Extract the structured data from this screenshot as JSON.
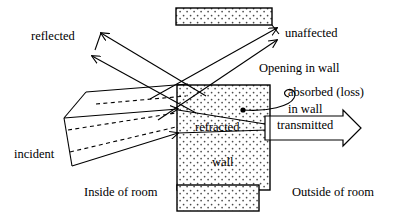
{
  "figure": {
    "background_color": "#ffffff",
    "line_color": "#000000",
    "fill_pattern": "dotted-stipple"
  },
  "labels": {
    "reflected": "reflected",
    "unaffected": "unaffected",
    "opening_in_wall": "Opening in wall",
    "absorbed": "absorbed (loss)",
    "in_wall": "in wall",
    "refracted": "refracted",
    "transmitted": "transmitted",
    "incident": "incident",
    "wall": "wall",
    "inside_of_room": "Inside of room",
    "outside_of_room": "Outside of room"
  },
  "shapes": {
    "opening_block": {
      "x": 176,
      "y": 8,
      "width": 96,
      "height": 17
    },
    "wall_block": {
      "x": 177,
      "y": 85,
      "width": 93,
      "height": 105
    },
    "legend_swatch": {
      "x": 177,
      "y": 185,
      "width": 82,
      "height": 26
    },
    "absorption_point": {
      "x": 243,
      "y": 110,
      "r": 2.6
    }
  },
  "beams": [
    {
      "name": "incident",
      "style": "solid-band-with-dashed-axis",
      "direction": "down-right"
    },
    {
      "name": "reflected",
      "style": "solid-band",
      "direction": "up-left"
    },
    {
      "name": "unaffected",
      "style": "solid-band",
      "direction": "up-right"
    },
    {
      "name": "refracted",
      "style": "solid-lines",
      "direction": "right"
    },
    {
      "name": "transmitted",
      "style": "hollow-arrow",
      "direction": "right"
    },
    {
      "name": "absorbed",
      "style": "curved-leader",
      "direction": "to-point"
    }
  ]
}
